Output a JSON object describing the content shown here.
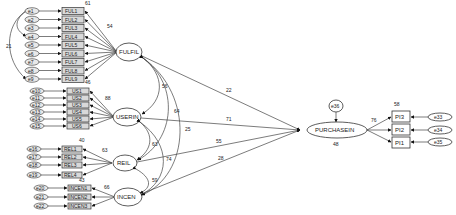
{
  "diagram": {
    "type": "structural-equation-model",
    "latent": {
      "fulfil": {
        "label": "FULFIL"
      },
      "userin": {
        "label": "USERIN"
      },
      "rel": {
        "label": "REIL"
      },
      "incen": {
        "label": "INCEN"
      },
      "purchase": {
        "label": "PURCHASEIN",
        "r2": "48",
        "error": "e36"
      }
    },
    "fulfil_items": [
      {
        "label": "FUL1",
        "error": "e1"
      },
      {
        "label": "FUL2",
        "error": "e2"
      },
      {
        "label": "FUL3",
        "error": "e3"
      },
      {
        "label": "FUL4",
        "error": "e4"
      },
      {
        "label": "FUL5",
        "error": "e5"
      },
      {
        "label": "FUL6",
        "error": "e6"
      },
      {
        "label": "FUL7",
        "error": "e7"
      },
      {
        "label": "FUL8",
        "error": "e8"
      },
      {
        "label": "FUL9",
        "error": "e9"
      }
    ],
    "fulfil_labels": {
      "top_r2": "61",
      "bottom_r2": "46",
      "loading": "54",
      "error_cov": "21"
    },
    "userin_items": [
      {
        "label": "US1",
        "error": "e10"
      },
      {
        "label": "US2",
        "error": "e11"
      },
      {
        "label": "US3",
        "error": "e12"
      },
      {
        "label": "US4",
        "error": "e13"
      },
      {
        "label": "US5",
        "error": "e14"
      },
      {
        "label": "US6",
        "error": "e15"
      }
    ],
    "userin_labels": {
      "loading": "88"
    },
    "rel_items": [
      {
        "label": "REL1",
        "error": "e16"
      },
      {
        "label": "REL2",
        "error": "e17"
      },
      {
        "label": "REL3",
        "error": "e18"
      },
      {
        "label": "REL4",
        "error": "e19"
      }
    ],
    "rel_labels": {
      "top_r2": "40",
      "bottom_r2": "43",
      "loading": "63"
    },
    "incen_items": [
      {
        "label": "INCEN1",
        "error": "e20"
      },
      {
        "label": "INCEN2",
        "error": "e21"
      },
      {
        "label": "INCEN3",
        "error": "e22"
      }
    ],
    "incen_labels": {
      "loading": "66"
    },
    "correlations": {
      "fulfil_userin": "56",
      "fulfil_rel": "64",
      "fulfil_incen": "25",
      "userin_rel": "63",
      "userin_incen": "74",
      "rel_incen": "59"
    },
    "paths": {
      "fulfil_purchase": "22",
      "userin_purchase": "71",
      "rel_purchase": "55",
      "incen_purchase": "28"
    },
    "pi_items": [
      {
        "label": "PI3",
        "error": "e33"
      },
      {
        "label": "PI2",
        "error": "e34"
      },
      {
        "label": "PI1",
        "error": "e35"
      }
    ],
    "pi_labels": {
      "loading": "76",
      "top_r2": "58"
    }
  }
}
